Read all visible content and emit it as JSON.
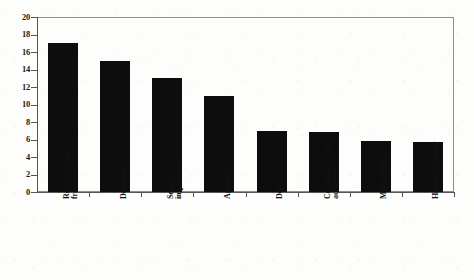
{
  "chart_data": {
    "type": "bar",
    "title": "",
    "subtitle": "",
    "xlabel": "",
    "ylabel": "",
    "ylim": [
      0,
      20
    ],
    "ytick_step": 2,
    "yticks": [
      "0",
      "2",
      "4",
      "6",
      "8",
      "10",
      "12",
      "14",
      "16",
      "18",
      "20"
    ],
    "grid": false,
    "legend": null,
    "bar_color": "#0d0d0d",
    "frame_color": "#8d8d8d",
    "categories": [
      "Recovery from fracture",
      "Dementia",
      "Sensory impairment",
      "Arthritis",
      "Depression",
      "Cerebrovascular accident",
      "Malnutrition",
      "History of cancer"
    ],
    "category_lines": [
      [
        "Recovery from",
        "fracture"
      ],
      [
        "Dementia"
      ],
      [
        "Sensory",
        "impairment"
      ],
      [
        "Arthritis"
      ],
      [
        "Depression"
      ],
      [
        "Cerebrovascular",
        "accident"
      ],
      [
        "Malnutrition"
      ],
      [
        "History of cancer"
      ]
    ],
    "values": [
      17,
      15,
      13,
      11,
      7,
      6.9,
      5.8,
      5.7
    ]
  }
}
